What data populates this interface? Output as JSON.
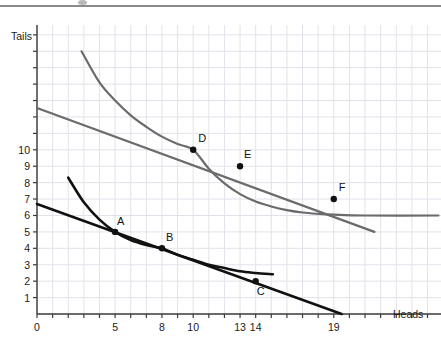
{
  "chart_data": {
    "type": "line",
    "title": "",
    "xlabel": "Heads",
    "ylabel": "Tails",
    "xlim": [
      0,
      25.9
    ],
    "ylim": [
      0,
      17.2
    ],
    "grid": true,
    "legend": null,
    "xticks": [
      0,
      5,
      8,
      10,
      13,
      14,
      19
    ],
    "xtick_labels": [
      "0",
      "5",
      "8",
      "10",
      "13",
      "14",
      "19"
    ],
    "yticks": [
      1,
      2,
      3,
      4,
      5,
      6,
      7,
      8,
      9,
      10
    ],
    "ytick_labels": [
      "1",
      "2",
      "3",
      "4",
      "5",
      "6",
      "7",
      "8",
      "9",
      "10"
    ],
    "minor_grid_step_x": 1,
    "minor_grid_step_y": 1,
    "colors": {
      "black_series": "#111111",
      "gray_series": "#6b6b6b",
      "grid": "#e2e2ea",
      "axis": "#3a3a3a",
      "background": "#ffffff"
    },
    "series": [
      {
        "name": "black-budget-line",
        "kind": "line",
        "style": "straight",
        "color": "#111111",
        "width": 2.6,
        "points": [
          [
            0,
            6.7
          ],
          [
            19.5,
            0
          ]
        ]
      },
      {
        "name": "black-indifference-curve",
        "kind": "line",
        "style": "curve",
        "color": "#111111",
        "width": 2.6,
        "points": [
          [
            2.0,
            8.3
          ],
          [
            3.0,
            6.8
          ],
          [
            4.0,
            5.75
          ],
          [
            5.0,
            5.0
          ],
          [
            6.0,
            4.5
          ],
          [
            7.0,
            4.2
          ],
          [
            8.0,
            4.0
          ],
          [
            9.0,
            3.6
          ],
          [
            10.0,
            3.3
          ],
          [
            11.0,
            3.0
          ],
          [
            12.0,
            2.8
          ],
          [
            13.0,
            2.6
          ],
          [
            14.0,
            2.5
          ],
          [
            15.1,
            2.42
          ]
        ]
      },
      {
        "name": "gray-budget-line",
        "kind": "line",
        "style": "straight",
        "color": "#6b6b6b",
        "width": 2.2,
        "points": [
          [
            0,
            12.55
          ],
          [
            21.6,
            5.0
          ]
        ]
      },
      {
        "name": "gray-indifference-curve",
        "kind": "line",
        "style": "curve",
        "color": "#6b6b6b",
        "width": 2.2,
        "points": [
          [
            2.85,
            16.0
          ],
          [
            4.0,
            14.1
          ],
          [
            5.0,
            13.0
          ],
          [
            6.0,
            12.1
          ],
          [
            7.0,
            11.4
          ],
          [
            8.0,
            10.8
          ],
          [
            9.0,
            10.35
          ],
          [
            10.0,
            10.0
          ],
          [
            11.0,
            8.85
          ],
          [
            12.0,
            7.95
          ],
          [
            13.0,
            7.3
          ],
          [
            14.0,
            6.85
          ],
          [
            15.0,
            6.55
          ],
          [
            16.0,
            6.33
          ],
          [
            17.0,
            6.18
          ],
          [
            18.0,
            6.1
          ],
          [
            19.0,
            6.05
          ],
          [
            21.0,
            6.0
          ],
          [
            25.7,
            6.0
          ]
        ]
      }
    ],
    "markers": [
      {
        "label": "A",
        "x": 5,
        "y": 5,
        "color": "#111111",
        "label_dx": 2,
        "label_dy": -7
      },
      {
        "label": "B",
        "x": 8,
        "y": 4,
        "color": "#111111",
        "label_dx": 4,
        "label_dy": -7
      },
      {
        "label": "C",
        "x": 14,
        "y": 2,
        "color": "#111111",
        "label_dx": 1,
        "label_dy": 14
      },
      {
        "label": "D",
        "x": 10,
        "y": 10,
        "color": "#111111",
        "label_dx": 5,
        "label_dy": -8
      },
      {
        "label": "E",
        "x": 13,
        "y": 9,
        "color": "#111111",
        "label_dx": 4,
        "label_dy": -8
      },
      {
        "label": "F",
        "x": 19,
        "y": 7,
        "color": "#111111",
        "label_dx": 5,
        "label_dy": -8
      }
    ]
  },
  "axes": {
    "y_title": "Tails",
    "x_title": "Heads"
  }
}
